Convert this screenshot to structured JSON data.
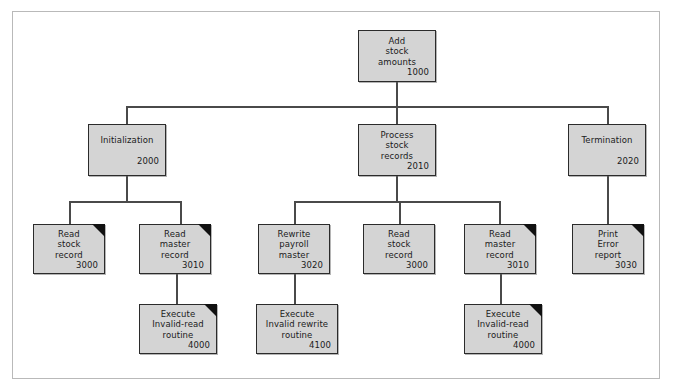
{
  "diagram": {
    "type": "structure-chart",
    "colors": {
      "node_fill": "#d4d4d4",
      "node_border": "#2b2b2b",
      "connector": "#4a4a4a",
      "dogear": "#111111",
      "frame_border": "#b9b9b9",
      "background": "#ffffff"
    },
    "nodes": [
      {
        "id": "add-stock-amounts",
        "lines": [
          "Add",
          "stock",
          "amounts"
        ],
        "number": "1000",
        "dogear": false,
        "level": 0,
        "x": 358,
        "y": 30,
        "w": 78,
        "h": 52
      },
      {
        "id": "initialization",
        "lines": [
          "Initialization",
          ""
        ],
        "number": "2000",
        "dogear": false,
        "level": 1,
        "x": 88,
        "y": 124,
        "w": 78,
        "h": 52
      },
      {
        "id": "process-stock-records",
        "lines": [
          "Process",
          "stock",
          "records"
        ],
        "number": "2010",
        "dogear": false,
        "level": 1,
        "x": 358,
        "y": 124,
        "w": 78,
        "h": 52
      },
      {
        "id": "termination",
        "lines": [
          "Termination",
          ""
        ],
        "number": "2020",
        "dogear": false,
        "level": 1,
        "x": 568,
        "y": 124,
        "w": 78,
        "h": 52
      },
      {
        "id": "read-stock-record-3000-a",
        "lines": [
          "Read",
          "stock",
          "record"
        ],
        "number": "3000",
        "dogear": true,
        "level": 2,
        "x": 33,
        "y": 224,
        "w": 72,
        "h": 50
      },
      {
        "id": "read-master-record-3010-a",
        "lines": [
          "Read",
          "master",
          "record"
        ],
        "number": "3010",
        "dogear": true,
        "level": 2,
        "x": 139,
        "y": 224,
        "w": 72,
        "h": 50
      },
      {
        "id": "rewrite-payroll-master-3020",
        "lines": [
          "Rewrite",
          "payroll",
          "master"
        ],
        "number": "3020",
        "dogear": false,
        "level": 2,
        "x": 258,
        "y": 224,
        "w": 72,
        "h": 50
      },
      {
        "id": "read-stock-record-3000-b",
        "lines": [
          "Read",
          "stock",
          "record"
        ],
        "number": "3000",
        "dogear": false,
        "level": 2,
        "x": 363,
        "y": 224,
        "w": 72,
        "h": 50
      },
      {
        "id": "read-master-record-3010-b",
        "lines": [
          "Read",
          "master",
          "record"
        ],
        "number": "3010",
        "dogear": true,
        "level": 2,
        "x": 464,
        "y": 224,
        "w": 72,
        "h": 50
      },
      {
        "id": "print-error-report-3030",
        "lines": [
          "Print",
          "Error",
          "report"
        ],
        "number": "3030",
        "dogear": true,
        "level": 2,
        "x": 572,
        "y": 224,
        "w": 72,
        "h": 50
      },
      {
        "id": "execute-invalid-read-routine-4000-a",
        "lines": [
          "Execute",
          "Invalid-read",
          "routine"
        ],
        "number": "4000",
        "dogear": true,
        "level": 3,
        "x": 139,
        "y": 304,
        "w": 78,
        "h": 50
      },
      {
        "id": "execute-invalid-rewrite-routine-4100",
        "lines": [
          "Execute",
          "Invalid rewrite",
          "routine"
        ],
        "number": "4100",
        "dogear": false,
        "level": 3,
        "x": 256,
        "y": 304,
        "w": 82,
        "h": 50
      },
      {
        "id": "execute-invalid-read-routine-4000-b",
        "lines": [
          "Execute",
          "Invalid-read",
          "routine"
        ],
        "number": "4000",
        "dogear": true,
        "level": 3,
        "x": 464,
        "y": 304,
        "w": 78,
        "h": 50
      }
    ],
    "connectors": [
      {
        "name": "root-stem",
        "orient": "v",
        "x": 396,
        "y": 82,
        "len": 25
      },
      {
        "name": "level1-bus",
        "orient": "h",
        "x": 126,
        "y": 106,
        "len": 482
      },
      {
        "name": "drop-initialization",
        "orient": "v",
        "x": 126,
        "y": 106,
        "len": 18
      },
      {
        "name": "drop-process",
        "orient": "v",
        "x": 396,
        "y": 106,
        "len": 18
      },
      {
        "name": "drop-termination",
        "orient": "v",
        "x": 607,
        "y": 106,
        "len": 18
      },
      {
        "name": "init-stem",
        "orient": "v",
        "x": 126,
        "y": 176,
        "len": 26
      },
      {
        "name": "init-bus",
        "orient": "h",
        "x": 69,
        "y": 201,
        "len": 112
      },
      {
        "name": "drop-read-stock-a",
        "orient": "v",
        "x": 69,
        "y": 201,
        "len": 23
      },
      {
        "name": "drop-read-master-a",
        "orient": "v",
        "x": 180,
        "y": 201,
        "len": 23
      },
      {
        "name": "process-stem",
        "orient": "v",
        "x": 396,
        "y": 176,
        "len": 26
      },
      {
        "name": "process-bus",
        "orient": "h",
        "x": 294,
        "y": 201,
        "len": 206
      },
      {
        "name": "drop-rewrite",
        "orient": "v",
        "x": 294,
        "y": 201,
        "len": 23
      },
      {
        "name": "drop-read-stock-b",
        "orient": "v",
        "x": 399,
        "y": 201,
        "len": 23
      },
      {
        "name": "drop-read-master-b",
        "orient": "v",
        "x": 499,
        "y": 201,
        "len": 23
      },
      {
        "name": "termination-stem",
        "orient": "v",
        "x": 607,
        "y": 176,
        "len": 48
      },
      {
        "name": "read-master-a-stem",
        "orient": "v",
        "x": 176,
        "y": 274,
        "len": 31
      },
      {
        "name": "rewrite-stem",
        "orient": "v",
        "x": 294,
        "y": 274,
        "len": 31
      },
      {
        "name": "read-master-b-stem",
        "orient": "v",
        "x": 500,
        "y": 274,
        "len": 31
      }
    ]
  }
}
